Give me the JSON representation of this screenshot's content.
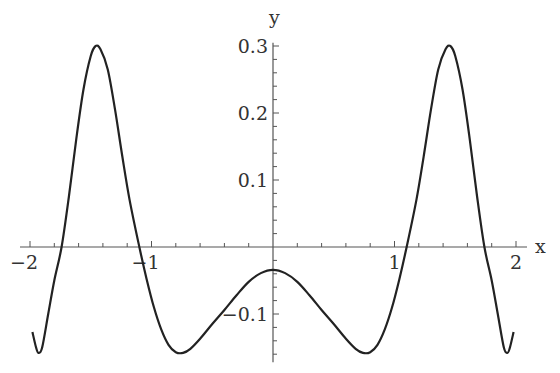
{
  "chart_data": {
    "type": "line",
    "title": "",
    "xlabel": "x",
    "ylabel": "y",
    "xlim": [
      -2,
      2
    ],
    "ylim": [
      -0.16,
      0.3
    ],
    "grid": false,
    "legend": null,
    "x_ticks": [
      -2,
      -1,
      1,
      2
    ],
    "x_tick_labels": [
      "−2",
      "−1",
      "1",
      "2"
    ],
    "y_ticks": [
      0.3,
      0.2,
      0.1,
      -0.1
    ],
    "y_tick_labels": [
      "0.3",
      "0.2",
      "0.1",
      "−0.1"
    ],
    "x_minor_step": 0.2,
    "y_minor_step": 0.02,
    "series": [
      {
        "name": "y(x)",
        "color": "#222222",
        "x": [
          -1.98,
          -1.95,
          -1.93,
          -1.9,
          -1.85,
          -1.8,
          -1.74,
          -1.68,
          -1.62,
          -1.56,
          -1.5,
          -1.46,
          -1.42,
          -1.36,
          -1.3,
          -1.24,
          -1.18,
          -1.1,
          -1.04,
          -0.98,
          -0.92,
          -0.86,
          -0.8,
          -0.74,
          -0.68,
          -0.6,
          -0.5,
          -0.4,
          -0.3,
          -0.2,
          -0.1,
          0,
          0.1,
          0.2,
          0.3,
          0.4,
          0.5,
          0.6,
          0.68,
          0.74,
          0.8,
          0.86,
          0.92,
          0.98,
          1.04,
          1.1,
          1.18,
          1.24,
          1.3,
          1.36,
          1.42,
          1.46,
          1.5,
          1.56,
          1.62,
          1.68,
          1.74,
          1.8,
          1.85,
          1.9,
          1.93,
          1.95,
          1.98
        ],
        "y": [
          -0.127,
          -0.15,
          -0.158,
          -0.15,
          -0.1,
          -0.05,
          0.0,
          0.075,
          0.16,
          0.235,
          0.285,
          0.3,
          0.295,
          0.265,
          0.205,
          0.135,
          0.07,
          0.0,
          -0.048,
          -0.09,
          -0.123,
          -0.146,
          -0.157,
          -0.158,
          -0.152,
          -0.137,
          -0.115,
          -0.094,
          -0.072,
          -0.052,
          -0.039,
          -0.034,
          -0.039,
          -0.052,
          -0.072,
          -0.094,
          -0.115,
          -0.137,
          -0.152,
          -0.158,
          -0.157,
          -0.146,
          -0.123,
          -0.09,
          -0.048,
          0.0,
          0.07,
          0.135,
          0.205,
          0.265,
          0.295,
          0.3,
          0.285,
          0.235,
          0.16,
          0.075,
          0.0,
          -0.05,
          -0.1,
          -0.15,
          -0.158,
          -0.15,
          -0.127
        ]
      }
    ]
  },
  "plot_frame": {
    "origin_px": [
      273,
      247
    ],
    "x_px_per_unit": 121.5,
    "y_px_per_unit": 670
  }
}
